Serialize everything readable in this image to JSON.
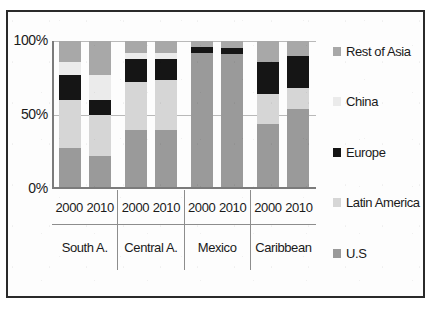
{
  "chart_data": {
    "type": "bar",
    "stacked": true,
    "normalized_percent": true,
    "title": "",
    "subtitle": "",
    "xlabel": "",
    "ylabel": "",
    "ylim": [
      0,
      100
    ],
    "yticks": [
      "0%",
      "50%",
      "100%"
    ],
    "ytick_values": [
      0,
      50,
      100
    ],
    "grid": true,
    "legend_position": "right",
    "groups": [
      "South A.",
      "Central A.",
      "Mexico",
      "Caribbean"
    ],
    "subcategories": [
      "2000",
      "2010"
    ],
    "categories": [
      "South A. 2000",
      "South A. 2010",
      "Central A. 2000",
      "Central A. 2010",
      "Mexico 2000",
      "Mexico 2010",
      "Caribbean 2000",
      "Caribbean 2010"
    ],
    "series": [
      {
        "name": "U.S",
        "color": "#9a9a9a",
        "values": [
          28,
          22,
          40,
          40,
          92,
          91,
          44,
          54
        ]
      },
      {
        "name": "Latin America",
        "color": "#d6d6d6",
        "values": [
          32,
          28,
          32,
          34,
          0,
          0,
          20,
          14
        ]
      },
      {
        "name": "Europe",
        "color": "#151515",
        "values": [
          17,
          10,
          16,
          14,
          4,
          4,
          22,
          22
        ]
      },
      {
        "name": "China",
        "color": "#ebebeb",
        "values": [
          9,
          17,
          4,
          4,
          0,
          0,
          0,
          0
        ]
      },
      {
        "name": "Rest of Asia",
        "color": "#a8a8a8",
        "values": [
          14,
          23,
          8,
          8,
          4,
          5,
          14,
          10
        ]
      }
    ],
    "stack_order_bottom_to_top": [
      "U.S",
      "Latin America",
      "Europe",
      "China",
      "Rest of Asia"
    ]
  },
  "axis": {
    "y": {
      "tick_100": "100%",
      "tick_50": "50%",
      "tick_0": "0%"
    }
  },
  "legend": {
    "items": [
      {
        "label": "Rest of Asia",
        "color": "#a8a8a8",
        "icon": "legend-swatch-icon"
      },
      {
        "label": "China",
        "color": "#ebebeb",
        "icon": "legend-swatch-icon"
      },
      {
        "label": "Europe",
        "color": "#151515",
        "icon": "legend-swatch-icon"
      },
      {
        "label": "Latin America",
        "color": "#d6d6d6",
        "icon": "legend-swatch-icon"
      },
      {
        "label": "U.S",
        "color": "#9a9a9a",
        "icon": "legend-swatch-icon"
      }
    ]
  },
  "xaxis": {
    "groups": [
      {
        "label": "South A.",
        "years": [
          "2000",
          "2010"
        ]
      },
      {
        "label": "Central A.",
        "years": [
          "2000",
          "2010"
        ]
      },
      {
        "label": "Mexico",
        "years": [
          "2000",
          "2010"
        ]
      },
      {
        "label": "Caribbean",
        "years": [
          "2000",
          "2010"
        ]
      }
    ]
  },
  "colors": {
    "frame": "#2a2a2a",
    "axis": "#7b7b7b",
    "gridline": "#b9b9b9",
    "background": "#ffffff",
    "text": "#1a1a1a"
  }
}
